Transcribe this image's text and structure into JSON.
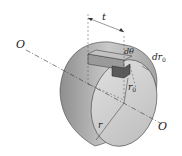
{
  "diagram": {
    "type": "shaft-torsion-element",
    "labels": {
      "axis_left": "O",
      "axis_right": "O",
      "length": "t",
      "angle": "dθ",
      "radial_thickness": "dr",
      "radial_thickness_sub": "0",
      "inner_radius": "r",
      "inner_radius_sub": "0",
      "outer_radius": "r"
    },
    "colors": {
      "shaft_face": "#d4d4d4",
      "shaft_side": "#a8a8a8",
      "element": "#555555",
      "line": "#333333"
    }
  }
}
